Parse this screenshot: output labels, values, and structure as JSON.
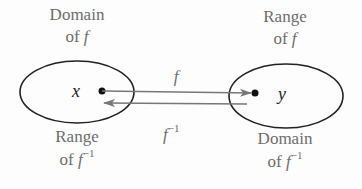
{
  "diagram": {
    "left_set": {
      "label_line1": "Domain",
      "label_line2_prefix": "of ",
      "label_line2_fn": "f",
      "element": "x",
      "bottom_label_line1": "Range",
      "bottom_label_line2_prefix": "of ",
      "bottom_label_line2_fn": "f",
      "bottom_label_line2_sup": "−1"
    },
    "right_set": {
      "label_line1": "Range",
      "label_line2_prefix": "of ",
      "label_line2_fn": "f",
      "element": "y",
      "bottom_label_line1": "Domain",
      "bottom_label_line2_prefix": "of ",
      "bottom_label_line2_fn": "f",
      "bottom_label_line2_sup": "−1"
    },
    "forward_arrow": {
      "label": "f"
    },
    "inverse_arrow": {
      "label": "f",
      "sup": "−1"
    },
    "colors": {
      "ellipse": "#222222",
      "arrow": "#777777",
      "text": "#6e6e6e",
      "dot": "#111111"
    }
  }
}
